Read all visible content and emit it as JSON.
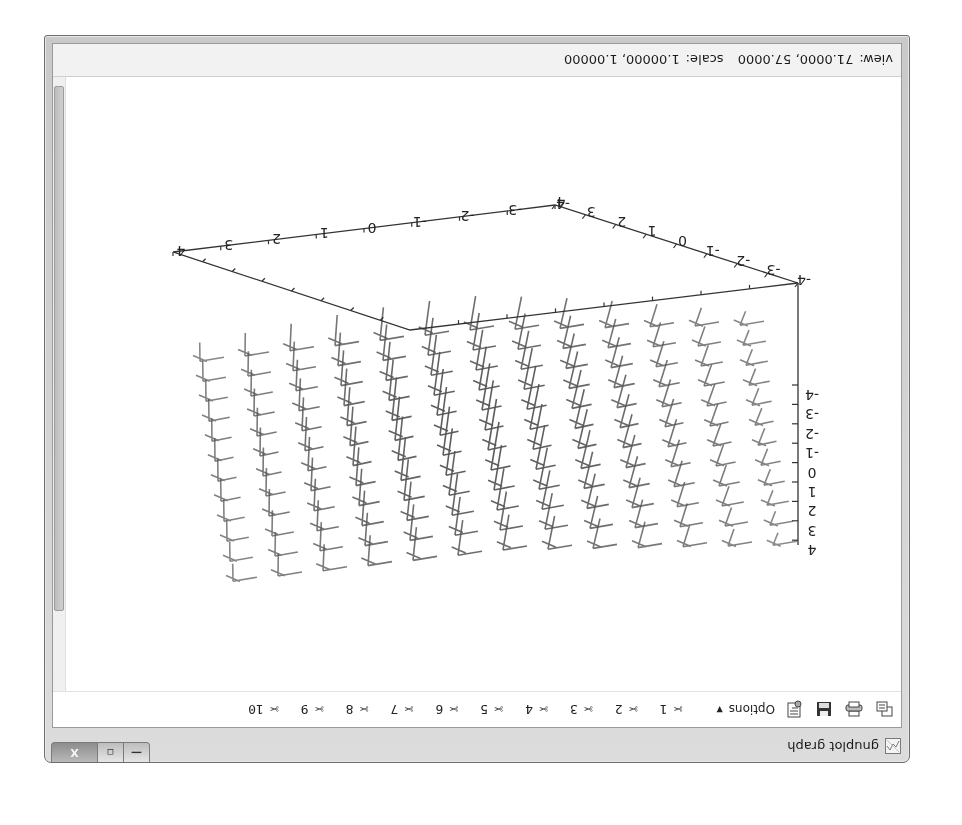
{
  "window": {
    "title": "gnuplot graph",
    "orientation": "rotated 180 degrees",
    "caption_buttons": {
      "minimize": "—",
      "maximize": "▫",
      "close": "X"
    }
  },
  "toolbar": {
    "icons": [
      "copy-to-clipboard-icon",
      "print-icon",
      "save-icon",
      "options-icon"
    ],
    "options_label": "Options",
    "options_caret": "▼",
    "marks": [
      {
        "glyph": "✂",
        "label": "1"
      },
      {
        "glyph": "✂",
        "label": "2"
      },
      {
        "glyph": "✂",
        "label": "3"
      },
      {
        "glyph": "✂",
        "label": "4"
      },
      {
        "glyph": "✂",
        "label": "5"
      },
      {
        "glyph": "✂",
        "label": "6"
      },
      {
        "glyph": "✂",
        "label": "7"
      },
      {
        "glyph": "✂",
        "label": "8"
      },
      {
        "glyph": "✂",
        "label": "9"
      },
      {
        "glyph": "✂",
        "label": "10"
      }
    ]
  },
  "statusbar": {
    "view_label": "view:",
    "view_value": "71.0000, 57.0000",
    "scale_label": "scale:",
    "scale_value": "1.00000, 1.00000"
  },
  "chart_data": {
    "type": "vector-field-3d",
    "title": "",
    "view": {
      "rot_x": 71.0,
      "rot_z": 57.0,
      "scale": 1.0,
      "scale_z": 1.0
    },
    "x_axis": {
      "ticks": [
        "-4",
        "-3",
        "-2",
        "-1",
        "0",
        "1",
        "2",
        "3",
        "4"
      ],
      "range": [
        -4,
        4
      ]
    },
    "y_axis": {
      "ticks": [
        "-4",
        "-3",
        "-2",
        "-1",
        "0",
        "1",
        "2",
        "3",
        "4"
      ],
      "range": [
        -4,
        4
      ]
    },
    "z_axis": {
      "ticks": [
        "-4",
        "-3",
        "-2",
        "-1",
        "0",
        "1",
        "2",
        "3",
        "4"
      ],
      "range": [
        -4,
        4
      ]
    },
    "grid": false,
    "legend": "none"
  },
  "plot_labels": {
    "x_ticks": [
      "4",
      "3",
      "2",
      "1",
      "0",
      "-1",
      "-2",
      "-3",
      "-4"
    ],
    "y_ticks": [
      "-4",
      "-3",
      "-2",
      "-1",
      "0",
      "1",
      "2",
      "3",
      "4"
    ],
    "z_ticks": [
      "-4",
      "-3",
      "-2",
      "-1",
      "0",
      "1",
      "2",
      "3",
      "4"
    ]
  }
}
